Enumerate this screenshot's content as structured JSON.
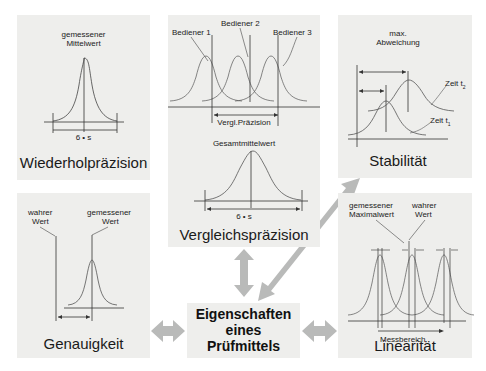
{
  "center": {
    "lines": [
      "Eigenschaften",
      "eines",
      "Prüfmittels"
    ]
  },
  "panels": {
    "wiederholpraezision": {
      "title": "Wiederholpräzision",
      "label_top_1": "gemessener",
      "label_top_2": "Mittelwert",
      "span_label": "6 • s"
    },
    "vergleichspraezision": {
      "title": "Vergleichspräzision",
      "operator_1": "Bediener 1",
      "operator_2": "Bediener 2",
      "operator_3": "Bediener 3",
      "span_top_label": "Vergl.Präzision",
      "mean_label": "Gesamtmittelwert",
      "span_label": "6 • s"
    },
    "stabilitaet": {
      "title": "Stabilität",
      "label_top_1": "max.",
      "label_top_2": "Abweichung",
      "time_2": "Zeit t",
      "time_2_sub": "2",
      "time_1": "Zeit t",
      "time_1_sub": "1"
    },
    "genauigkeit": {
      "title": "Genauigkeit",
      "true_1": "wahrer",
      "true_2": "Wert",
      "meas_1": "gemessener",
      "meas_2": "Wert"
    },
    "linearitaet": {
      "title": "Linearität",
      "meas_1": "gemessener",
      "meas_2": "Maximalwert",
      "true_1": "wahrer",
      "true_2": "Wert",
      "axis_label": "Messbereich"
    }
  },
  "colors": {
    "panel_bg": "#eeeeec",
    "arrow": "#b9bab9",
    "line": "#333333"
  }
}
